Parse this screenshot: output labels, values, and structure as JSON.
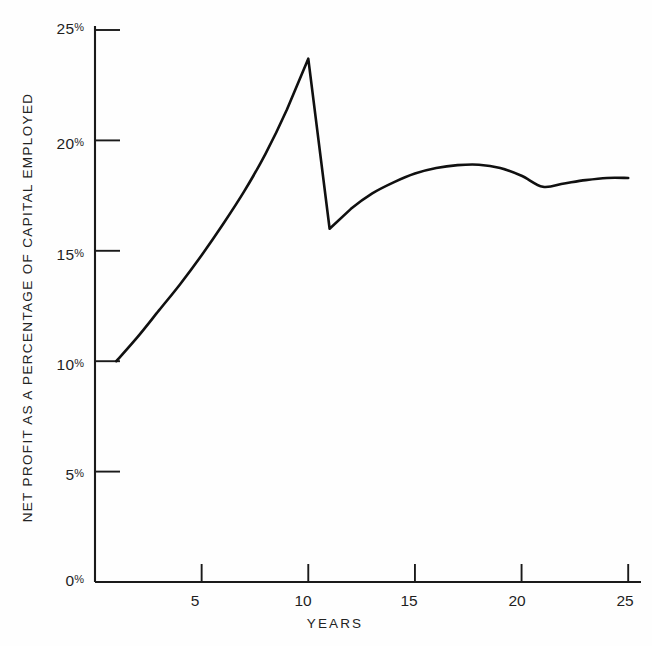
{
  "chart_data": {
    "type": "line",
    "title": "",
    "subtitle": "",
    "xlabel": "YEARS",
    "ylabel": "NET PROFIT AS A PERCENTAGE OF CAPITAL EMPLOYED",
    "xlim": [
      0,
      25.6
    ],
    "ylim": [
      0,
      25
    ],
    "xticks": [
      5,
      10,
      15,
      20,
      25
    ],
    "xtick_labels": [
      "5",
      "10",
      "15",
      "20",
      "25"
    ],
    "yticks": [
      0,
      5,
      10,
      15,
      20,
      25
    ],
    "ytick_labels": [
      "0%",
      "5%",
      "10%",
      "15%",
      "20%",
      "25%"
    ],
    "grid": false,
    "legend": "none",
    "line_color": "#101010",
    "background_color": "#fefefe",
    "axis_color": "#1a1a1a",
    "series": [
      {
        "name": "Net profit as a percentage of capital employed",
        "x": [
          1,
          2,
          3,
          4,
          5,
          6,
          7,
          8,
          9,
          10,
          11,
          12,
          13,
          14,
          15,
          16,
          17,
          18,
          19,
          20,
          21,
          22,
          23,
          24,
          25
        ],
        "values": [
          10.0,
          11.1,
          12.3,
          13.5,
          14.8,
          16.2,
          17.7,
          19.4,
          21.4,
          23.7,
          16.0,
          16.9,
          17.6,
          18.1,
          18.5,
          18.75,
          18.88,
          18.9,
          18.75,
          18.4,
          17.9,
          18.05,
          18.2,
          18.3,
          18.3
        ]
      }
    ],
    "annotations": [
      {
        "label": "start",
        "x": 1,
        "y": 10.0
      },
      {
        "label": "peak",
        "x": 10,
        "y": 23.7
      },
      {
        "label": "trough after drop",
        "x": 11,
        "y": 16.0
      },
      {
        "label": "local maximum",
        "x": 18,
        "y": 18.9
      },
      {
        "label": "local minimum",
        "x": 21,
        "y": 17.9
      },
      {
        "label": "end",
        "x": 25,
        "y": 18.3
      }
    ]
  },
  "axis": {
    "y_title": "NET PROFIT AS A PERCENTAGE OF CAPITAL EMPLOYED",
    "x_title": "YEARS",
    "y_ticks": [
      {
        "value": "25",
        "suffix": "%"
      },
      {
        "value": "20",
        "suffix": "%"
      },
      {
        "value": "15",
        "suffix": "%"
      },
      {
        "value": "10",
        "suffix": "%"
      },
      {
        "value": "5",
        "suffix": "%"
      },
      {
        "value": "0",
        "suffix": "%"
      }
    ],
    "x_ticks": [
      "5",
      "10",
      "15",
      "20",
      "25"
    ]
  }
}
